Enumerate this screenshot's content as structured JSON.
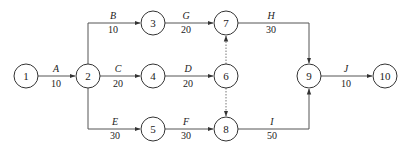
{
  "diagram": {
    "type": "activity-on-arrow network",
    "nodes": [
      {
        "id": "1",
        "label": "1",
        "x": 26,
        "y": 76
      },
      {
        "id": "2",
        "label": "2",
        "x": 88,
        "y": 76
      },
      {
        "id": "3",
        "label": "3",
        "x": 153,
        "y": 23
      },
      {
        "id": "4",
        "label": "4",
        "x": 153,
        "y": 76
      },
      {
        "id": "5",
        "label": "5",
        "x": 153,
        "y": 129
      },
      {
        "id": "6",
        "label": "6",
        "x": 226,
        "y": 76
      },
      {
        "id": "7",
        "label": "7",
        "x": 226,
        "y": 23
      },
      {
        "id": "8",
        "label": "8",
        "x": 226,
        "y": 129
      },
      {
        "id": "9",
        "label": "9",
        "x": 309,
        "y": 76
      },
      {
        "id": "10",
        "label": "10",
        "x": 385,
        "y": 76
      }
    ],
    "activities": [
      {
        "name": "A",
        "duration": "10",
        "from": "1",
        "to": "2"
      },
      {
        "name": "B",
        "duration": "10",
        "from": "2",
        "to": "3"
      },
      {
        "name": "C",
        "duration": "20",
        "from": "2",
        "to": "4"
      },
      {
        "name": "E",
        "duration": "30",
        "from": "2",
        "to": "5"
      },
      {
        "name": "G",
        "duration": "20",
        "from": "3",
        "to": "7"
      },
      {
        "name": "D",
        "duration": "20",
        "from": "4",
        "to": "6"
      },
      {
        "name": "F",
        "duration": "30",
        "from": "5",
        "to": "8"
      },
      {
        "name": "H",
        "duration": "30",
        "from": "7",
        "to": "9"
      },
      {
        "name": "I",
        "duration": "50",
        "from": "8",
        "to": "9"
      },
      {
        "name": "J",
        "duration": "10",
        "from": "9",
        "to": "10"
      }
    ],
    "dummy_activities": [
      {
        "from": "6",
        "to": "7"
      },
      {
        "from": "6",
        "to": "8"
      }
    ]
  }
}
